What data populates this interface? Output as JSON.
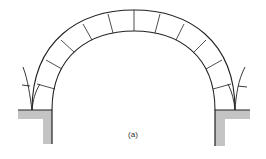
{
  "figure": {
    "label": "(a)",
    "voussoir_count": 14,
    "colors": {
      "line": "#222222",
      "abutment_fill": "#bdbdbd",
      "background": "#ffffff"
    }
  }
}
